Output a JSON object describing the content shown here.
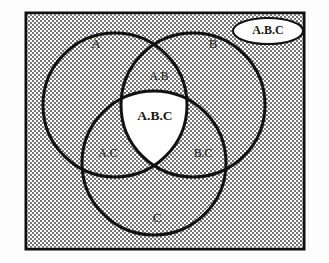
{
  "diagram": {
    "type": "venn",
    "set_count": 3,
    "title": "",
    "frame": {
      "border_color": "#111111",
      "border_width_px": 3,
      "fill_pattern": "checkerboard-dither",
      "fill_color_light": "#ffffff",
      "fill_color_dark": "#6f6f6f",
      "fill_tone": "#c9c9c9"
    },
    "stroke_color": "#111111",
    "circle_stroke_width_px": 3,
    "intersection_fill": "#ffffff",
    "sets": [
      {
        "id": "A",
        "label": "A",
        "cx": 115,
        "cy": 105,
        "r": 72
      },
      {
        "id": "B",
        "label": "B",
        "cx": 193,
        "cy": 105,
        "r": 72
      },
      {
        "id": "C",
        "label": "C",
        "cx": 154,
        "cy": 163,
        "r": 72
      }
    ],
    "regions": [
      {
        "id": "A-only",
        "label": "A",
        "x": 96,
        "y": 45,
        "kind": "single"
      },
      {
        "id": "B-only",
        "label": "B",
        "x": 213,
        "y": 45,
        "kind": "single"
      },
      {
        "id": "C-only",
        "label": "C",
        "x": 157,
        "y": 219,
        "kind": "single"
      },
      {
        "id": "A-and-B",
        "label": "A.B",
        "x": 159,
        "y": 77,
        "kind": "pair"
      },
      {
        "id": "A-and-C",
        "label": "A.C",
        "x": 108,
        "y": 154,
        "kind": "pair"
      },
      {
        "id": "B-and-C",
        "label": "B.C",
        "x": 203,
        "y": 154,
        "kind": "pair"
      },
      {
        "id": "A-B-C",
        "label": "A.B.C",
        "x": 155,
        "y": 117,
        "kind": "triple"
      }
    ],
    "callout": {
      "label": "A.B.C",
      "shape": "ellipse",
      "cx": 268,
      "cy": 31,
      "rx": 35,
      "ry": 13,
      "fill": "#ffffff",
      "stroke": "#111111"
    }
  }
}
